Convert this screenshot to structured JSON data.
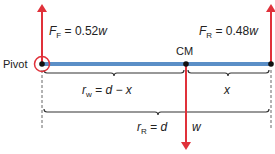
{
  "diagram": {
    "type": "free-body diagram of a beam (lever)",
    "labels": {
      "pivot": "Pivot",
      "cm": "CM",
      "force_left": {
        "symbol": "F",
        "subscript": "F",
        "equals": " = 0.52",
        "var": "w"
      },
      "force_right": {
        "symbol": "F",
        "subscript": "R",
        "equals": " = 0.48",
        "var": "w"
      },
      "weight": "w",
      "brace_left": {
        "symbol": "r",
        "subscript": "w",
        "expr": " = d − x"
      },
      "brace_right": "x",
      "brace_full": {
        "symbol": "r",
        "subscript": "R",
        "expr": " = d"
      }
    },
    "colors": {
      "force_arrow": "#e0313a",
      "beam": "#5b8fc7",
      "pivot_ring": "#e0313a",
      "line": "#333333"
    }
  }
}
